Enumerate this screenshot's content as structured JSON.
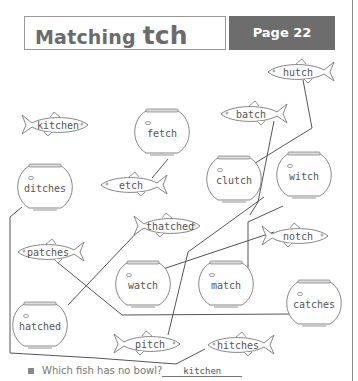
{
  "header": {
    "title_prefix": "Matching",
    "title_focus": "tch",
    "page_label": "Page 22"
  },
  "fish": [
    {
      "id": "hutch",
      "label": "hutch",
      "x": 300,
      "y": 72,
      "dir": "left"
    },
    {
      "id": "batch",
      "label": "batch",
      "x": 253,
      "y": 114,
      "dir": "left"
    },
    {
      "id": "kitchen",
      "label": "kitchen",
      "x": 56,
      "y": 125,
      "dir": "right"
    },
    {
      "id": "etch",
      "label": "etch",
      "x": 133,
      "y": 185,
      "dir": "left"
    },
    {
      "id": "thatched",
      "label": "thatched",
      "x": 168,
      "y": 226,
      "dir": "right"
    },
    {
      "id": "notch",
      "label": "notch",
      "x": 296,
      "y": 236,
      "dir": "right"
    },
    {
      "id": "patches",
      "label": "patches",
      "x": 50,
      "y": 252,
      "dir": "left"
    },
    {
      "id": "pitch",
      "label": "pitch",
      "x": 148,
      "y": 344,
      "dir": "right"
    },
    {
      "id": "hitches",
      "label": "hitches",
      "x": 240,
      "y": 345,
      "dir": "left"
    }
  ],
  "bowls": [
    {
      "id": "fetch",
      "label": "fetch",
      "x": 162,
      "y": 133
    },
    {
      "id": "ditches",
      "label": "ditches",
      "x": 45,
      "y": 188
    },
    {
      "id": "clutch",
      "label": "clutch",
      "x": 234,
      "y": 180
    },
    {
      "id": "witch",
      "label": "witch",
      "x": 304,
      "y": 176
    },
    {
      "id": "watch",
      "label": "watch",
      "x": 143,
      "y": 285
    },
    {
      "id": "match",
      "label": "match",
      "x": 226,
      "y": 285
    },
    {
      "id": "hatched",
      "label": "hatched",
      "x": 40,
      "y": 326
    },
    {
      "id": "catches",
      "label": "catches",
      "x": 314,
      "y": 304
    }
  ],
  "question": {
    "text": "Which fish has no bowl?",
    "answer": "kitchen"
  },
  "colors": {
    "line": "#555555",
    "outline": "#777777",
    "page_box": "#6d6d6d",
    "title_text": "#6b6b6b"
  }
}
